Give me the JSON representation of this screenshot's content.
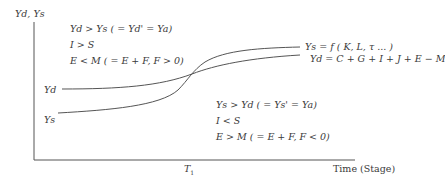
{
  "diagram": {
    "y_axis_label": "Yd, Ys",
    "x_axis_label": "Time (Stage)",
    "x_tick_label": "T",
    "x_tick_subscript": "1",
    "upper_left_block": {
      "line1": "Yd > Ys ( = Yd' = Ya)",
      "line2": "I > S",
      "line3": "E < M ( = E + F, F > 0)"
    },
    "lower_right_block": {
      "line1": "Ys > Yd ( = Ys' = Ya)",
      "line2": "I < S",
      "line3": "E > M ( = E + F, F < 0)"
    },
    "curves": {
      "yd_start_label": "Yd",
      "ys_start_label": "Ys",
      "ys_end_label": "Ys = f ( K, L,   τ ... )",
      "yd_end_label": "Yd = C + G + I + J + E − M"
    },
    "line_color": "#555555"
  }
}
